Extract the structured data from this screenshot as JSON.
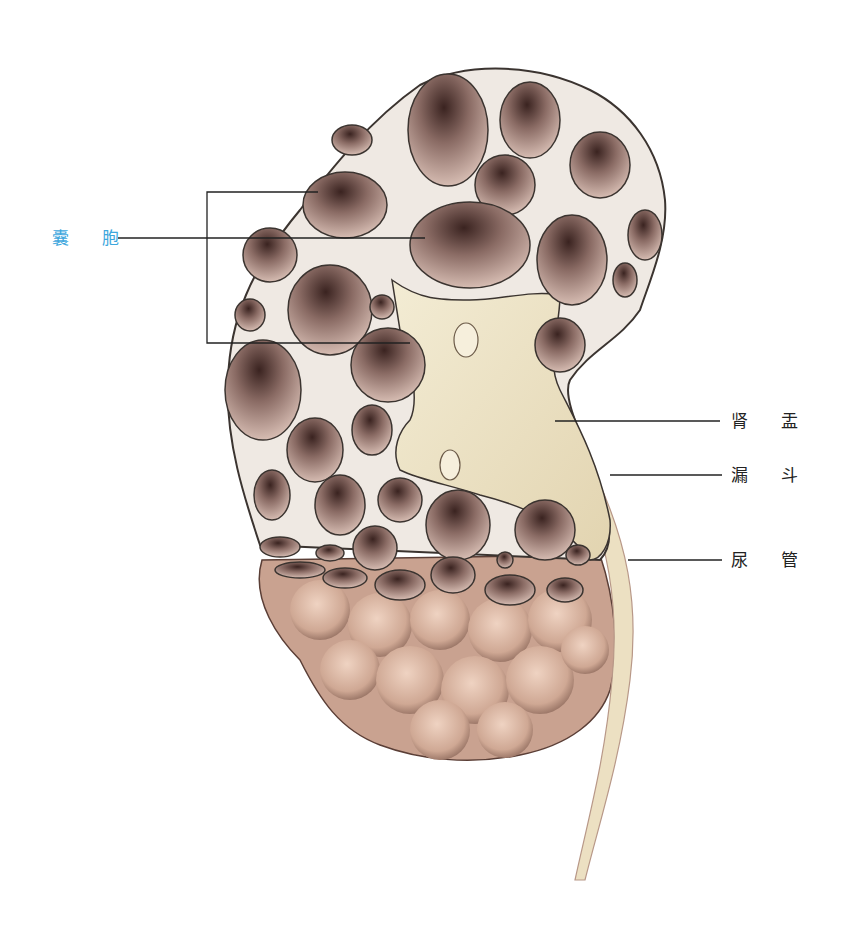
{
  "diagram": {
    "colors": {
      "cortex": "#efe9e3",
      "cyst_fill": "#c8aaa0",
      "cyst_dark": "#3a2320",
      "pelvis": "#eee4c8",
      "outer_lobes": "#d9b3a0",
      "outline": "#3b3430",
      "label_blue": "#3ea7dd",
      "label_black": "#222222",
      "leader_line": "#222222"
    },
    "labels": {
      "cyst": "囊 胞",
      "renal_pelvis": "肾 盂",
      "infundibulum": "漏 斗",
      "ureter": "尿 管"
    }
  }
}
